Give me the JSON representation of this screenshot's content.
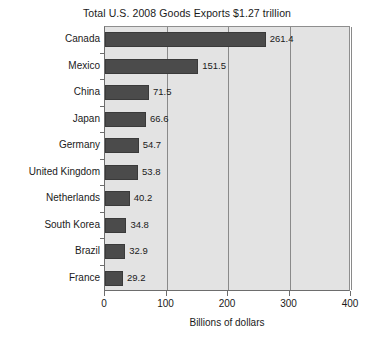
{
  "chart_data": {
    "type": "bar",
    "orientation": "horizontal",
    "title": "Total U.S. 2008 Goods Exports $1.27 trillion",
    "xlabel": "Billions of dollars",
    "ylabel": "",
    "xlim": [
      0,
      400
    ],
    "xticks": [
      0,
      100,
      200,
      300,
      400
    ],
    "xtick_labels": [
      "0",
      "100",
      "200",
      "300",
      "400"
    ],
    "grid": true,
    "grid_axis": "x",
    "legend": false,
    "categories": [
      "Canada",
      "Mexico",
      "China",
      "Japan",
      "Germany",
      "United Kingdom",
      "Netherlands",
      "South Korea",
      "Brazil",
      "France"
    ],
    "values": [
      261.4,
      151.5,
      71.5,
      66.6,
      54.7,
      53.8,
      40.2,
      34.8,
      32.9,
      29.2
    ],
    "value_labels": [
      "261.4",
      "151.5",
      "71.5",
      "66.6",
      "54.7",
      "53.8",
      "40.2",
      "34.8",
      "32.9",
      "29.2"
    ],
    "bar_color": "#4b4b4b",
    "plot_background": "#e3e3e3",
    "gridline_color": "#8a8a8a",
    "axis_color": "#6d6d6d",
    "text_color": "#1a1a1a"
  }
}
